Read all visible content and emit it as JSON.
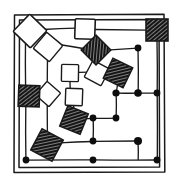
{
  "figure": {
    "type": "diagram",
    "background_color": "#ffffff",
    "ink_color": "#1a1a1a",
    "canvas": {
      "width": 178,
      "height": 190
    }
  },
  "border": {
    "name": "double-rectangle-frame",
    "outer": {
      "x": 13,
      "y": 14,
      "width": 152,
      "height": 159
    },
    "inner": {
      "x": 18,
      "y": 19,
      "width": 142,
      "height": 149
    },
    "stroke_color": "#1a1a1a",
    "stroke_width": 1.4
  },
  "legend": {
    "white_square_label": "unassigned node",
    "hatched_square_label": "hatched node",
    "dot_label": "junction point"
  },
  "chart_data": {
    "type": "diagram",
    "xlabel": "",
    "ylabel": "",
    "xlim": [
      0,
      178
    ],
    "ylim": [
      0,
      190
    ],
    "grid": false,
    "legend_position": "none",
    "counts": {
      "white_squares": 7,
      "hatched_squares": 6,
      "dots": 13,
      "edges": 22
    },
    "white_squares": [
      {
        "id": "w1",
        "cx": 30,
        "cy": 31,
        "size": 24,
        "rotation": 44
      },
      {
        "id": "w2",
        "cx": 48,
        "cy": 47,
        "size": 21,
        "rotation": 40
      },
      {
        "id": "w3",
        "cx": 85,
        "cy": 29,
        "size": 20,
        "rotation": 2
      },
      {
        "id": "w4",
        "cx": 70,
        "cy": 73,
        "size": 17,
        "rotation": 1
      },
      {
        "id": "w5",
        "cx": 97,
        "cy": 73,
        "size": 19,
        "rotation": 28
      },
      {
        "id": "w6",
        "cx": 48,
        "cy": 94,
        "size": 18,
        "rotation": 41
      },
      {
        "id": "w7",
        "cx": 74,
        "cy": 97,
        "size": 17,
        "rotation": 2
      }
    ],
    "hatched_squares": [
      {
        "id": "h1",
        "cx": 157,
        "cy": 30,
        "size": 22,
        "rotation": 0
      },
      {
        "id": "h2",
        "cx": 96,
        "cy": 50,
        "size": 21,
        "rotation": 45
      },
      {
        "id": "h3",
        "cx": 118,
        "cy": 73,
        "size": 22,
        "rotation": 26
      },
      {
        "id": "h4",
        "cx": 29,
        "cy": 96,
        "size": 21,
        "rotation": 2
      },
      {
        "id": "h5",
        "cx": 74,
        "cy": 120,
        "size": 22,
        "rotation": 22
      },
      {
        "id": "h6",
        "cx": 47,
        "cy": 145,
        "size": 24,
        "rotation": 28
      }
    ],
    "dots": [
      {
        "id": "d1",
        "x": 138,
        "y": 48,
        "r": 3.4
      },
      {
        "id": "d2",
        "x": 157,
        "y": 93,
        "r": 3.4
      },
      {
        "id": "d3",
        "x": 138,
        "y": 93,
        "r": 3.8
      },
      {
        "id": "d4",
        "x": 116,
        "y": 93,
        "r": 3.6
      },
      {
        "id": "d5",
        "x": 116,
        "y": 118,
        "r": 3.4
      },
      {
        "id": "d6",
        "x": 93,
        "y": 118,
        "r": 3.4
      },
      {
        "id": "d7",
        "x": 138,
        "y": 141,
        "r": 4.0
      },
      {
        "id": "d8",
        "x": 93,
        "y": 141,
        "r": 3.4
      },
      {
        "id": "d9",
        "x": 157,
        "y": 160,
        "r": 3.4
      },
      {
        "id": "d10",
        "x": 93,
        "y": 160,
        "r": 3.4
      },
      {
        "id": "d11",
        "x": 26,
        "y": 160,
        "r": 3.4
      },
      {
        "id": "d12",
        "x": 138,
        "y": 93,
        "r": 3.8
      },
      {
        "id": "d13",
        "x": 93,
        "y": 118,
        "r": 3.4
      }
    ],
    "edges": [
      {
        "from": "w1",
        "to": "w3",
        "path": "M 44 30 L 75 28"
      },
      {
        "from": "w3",
        "to": "h1",
        "path": "M 96 30 L 146 30"
      },
      {
        "from": "h1",
        "to": "d2",
        "path": "M 157 41 L 157 93"
      },
      {
        "from": "w2",
        "to": "h2",
        "path": "M 60 44 L 86 49"
      },
      {
        "from": "h2",
        "to": "d1",
        "path": "M 107 50 L 138 48"
      },
      {
        "from": "d1",
        "to": "d3",
        "path": "M 138 48 L 138 93"
      },
      {
        "from": "w4",
        "to": "w5",
        "path": "M 79 72 L 88 72"
      },
      {
        "from": "w5",
        "to": "h3",
        "path": "M 106 71 L 110 72"
      },
      {
        "from": "h3",
        "to": "d4",
        "path": "M 118 85 L 116 93"
      },
      {
        "from": "d2",
        "to": "d3",
        "path": "M 157 93 L 138 93"
      },
      {
        "from": "d3",
        "to": "d4",
        "path": "M 138 93 L 116 93"
      },
      {
        "from": "d4",
        "to": "d5",
        "path": "M 116 93 L 116 118"
      },
      {
        "from": "d5",
        "to": "d6",
        "path": "M 116 118 L 93 118"
      },
      {
        "from": "d6",
        "to": "h5",
        "path": "M 93 118 L 85 119"
      },
      {
        "from": "w4",
        "to": "w7",
        "path": "M 70 82 L 70 89"
      },
      {
        "from": "w7",
        "to": "h5",
        "path": "M 74 106 L 74 110"
      },
      {
        "from": "h4",
        "to": "d11",
        "path": "M 26 107 L 26 160"
      },
      {
        "from": "h6",
        "to": "d7",
        "path": "M 60 143 L 138 141"
      },
      {
        "from": "d7",
        "to": "d9",
        "path": "M 138 141 L 138 160"
      },
      {
        "from": "d8",
        "to": "d7",
        "path": "M 93 141 L 138 141"
      },
      {
        "from": "d8",
        "to": "d10",
        "path": "M 93 141 L 93 160"
      },
      {
        "from": "d11",
        "to": "d9",
        "path": "M 26 160 L 157 160"
      }
    ]
  }
}
